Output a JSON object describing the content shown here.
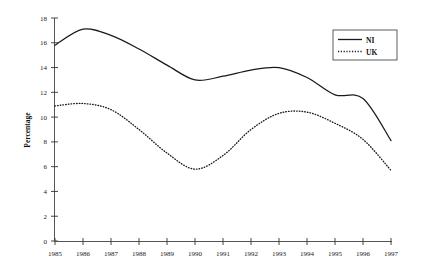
{
  "chart_data": {
    "type": "line",
    "title": "",
    "subtitle": "",
    "xlabel": "",
    "ylabel": "Percentage",
    "x": [
      1985,
      1986,
      1987,
      1988,
      1989,
      1990,
      1991,
      1992,
      1993,
      1994,
      1995,
      1996,
      1997
    ],
    "xtick_labels": [
      "1985",
      "1986",
      "1987",
      "1988",
      "1989",
      "1990",
      "1991",
      "1992",
      "1993",
      "1994",
      "1995",
      "1996",
      "1997"
    ],
    "ytick_labels": [
      "0",
      "2",
      "4",
      "6",
      "8",
      "10",
      "12",
      "14",
      "16",
      "18"
    ],
    "yticks": [
      0,
      2,
      4,
      6,
      8,
      10,
      12,
      14,
      16,
      18
    ],
    "xlim": [
      1985,
      1997
    ],
    "ylim": [
      0,
      18
    ],
    "grid": false,
    "legend_position": "top-right",
    "series": [
      {
        "name": "NI",
        "style": "solid",
        "color": "#1a1a1a",
        "values": [
          15.8,
          17.1,
          16.6,
          15.5,
          14.2,
          13.0,
          13.3,
          13.8,
          14.0,
          13.2,
          11.8,
          11.5,
          8.1
        ]
      },
      {
        "name": "UK",
        "style": "dotted",
        "color": "#1a1a1a",
        "values": [
          10.9,
          11.1,
          10.6,
          9.0,
          7.1,
          5.8,
          6.9,
          9.0,
          10.3,
          10.4,
          9.5,
          8.2,
          5.7
        ]
      }
    ]
  },
  "legend": {
    "items": [
      {
        "label": "NI"
      },
      {
        "label": "UK"
      }
    ]
  },
  "axes": {
    "y_title": "Percentage"
  }
}
